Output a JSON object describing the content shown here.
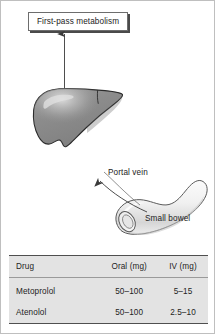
{
  "figure": {
    "callout": {
      "label": "First-pass metabolism"
    },
    "labels": {
      "portal_vein": "Portal vein",
      "small_bowel": "Small bowel",
      "liver": "liver",
      "bowel": "small bowel"
    },
    "colors": {
      "liver_fill": "#8a8a8a",
      "liver_outline": "#2b2b2b",
      "liver_highlight": "#d8d8d8",
      "bowel_fill": "#f2f2f2",
      "bowel_outline": "#5a5a5a",
      "arrow": "#3a3a3a",
      "table_bg": "#e3e3e3",
      "table_rule": "#4f4f4f",
      "text": "#232323",
      "frame": "#bfbfbf"
    }
  },
  "table": {
    "columns": [
      "Drug",
      "Oral (mg)",
      "IV (mg)"
    ],
    "rows": [
      [
        "Metoprolol",
        "50–100",
        "5–15"
      ],
      [
        "Atenolol",
        "50–100",
        "2.5–10"
      ]
    ]
  }
}
